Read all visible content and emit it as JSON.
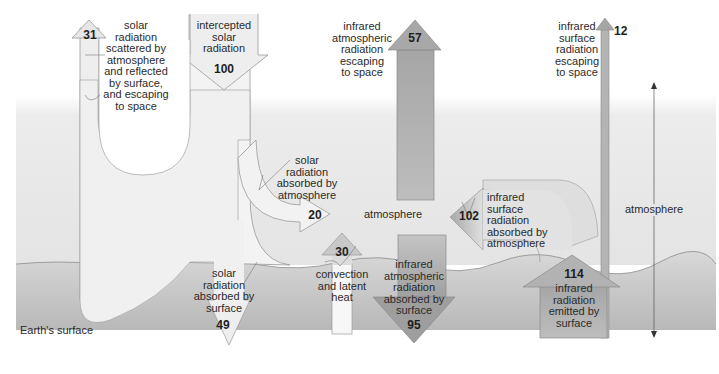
{
  "diagram": {
    "regions": {
      "atmosphere_label": "atmosphere",
      "atmosphere_scale_label": "atmosphere",
      "surface_label": "Earth's surface"
    },
    "flows": [
      {
        "id": "intercepted_solar",
        "value": "100",
        "label": [
          "intercepted",
          "solar",
          "radiation"
        ],
        "direction": "down"
      },
      {
        "id": "solar_reflected_escaping",
        "value": "31",
        "label": [
          "solar",
          "radiation",
          "scattered by",
          "atmosphere",
          "and reflected",
          "by surface,",
          "and escaping",
          "to space"
        ],
        "direction": "up"
      },
      {
        "id": "solar_absorbed_atmosphere",
        "value": "20",
        "label": [
          "solar",
          "radiation",
          "absorbed by",
          "atmosphere"
        ],
        "direction": "right"
      },
      {
        "id": "solar_absorbed_surface",
        "value": "49",
        "label": [
          "solar",
          "radiation",
          "absorbed by",
          "surface"
        ],
        "direction": "down"
      },
      {
        "id": "ir_atmospheric_escaping",
        "value": "57",
        "label": [
          "infrared",
          "atmospheric",
          "radiation",
          "escaping",
          "to space"
        ],
        "direction": "up"
      },
      {
        "id": "ir_surface_escaping",
        "value": "12",
        "label": [
          "infrared",
          "surface",
          "radiation",
          "escaping",
          "to space"
        ],
        "direction": "up"
      },
      {
        "id": "ir_surface_absorbed_atmosphere",
        "value": "102",
        "label": [
          "infrared",
          "surface",
          "radiation",
          "absorbed by",
          "atmosphere"
        ],
        "direction": "left"
      },
      {
        "id": "convection_latent_heat",
        "value": "30",
        "label": [
          "convection",
          "and latent",
          "heat"
        ],
        "direction": "up"
      },
      {
        "id": "ir_atmospheric_absorbed_surface",
        "value": "95",
        "label": [
          "infrared",
          "atmospheric",
          "radiation",
          "absorbed by",
          "surface"
        ],
        "direction": "down"
      },
      {
        "id": "ir_emitted_surface",
        "value": "114",
        "label": [
          "infrared",
          "radiation",
          "emitted by",
          "surface"
        ],
        "direction": "up"
      }
    ],
    "colors": {
      "solar_fill": "#eeeeee",
      "ir_fill": "#a9a9a9",
      "ir_fill_light": "#c9c9c9",
      "outline": "#8a8a8a",
      "atmosphere_bg": "#e2e2e2",
      "surface_band": "#c4c4c4"
    }
  }
}
